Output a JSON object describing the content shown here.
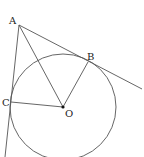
{
  "diagram": {
    "points": {
      "A": {
        "label": "A",
        "x": 19,
        "y": 25
      },
      "B": {
        "label": "B",
        "x": 88,
        "y": 62
      },
      "C": {
        "label": "C",
        "x": 11,
        "y": 102
      },
      "O": {
        "label": "O",
        "x": 63,
        "y": 107
      }
    },
    "circle": {
      "center": "O",
      "cx": 63,
      "cy": 107,
      "r": 53
    },
    "segments": [
      {
        "from": "A",
        "to": "O"
      },
      {
        "from": "O",
        "to": "B"
      },
      {
        "from": "O",
        "to": "C"
      }
    ],
    "lines": [
      {
        "through": [
          "A",
          "B"
        ],
        "note": "tangent at B"
      },
      {
        "through": [
          "A",
          "C"
        ],
        "note": "tangent at C"
      }
    ],
    "colors": {
      "stroke": "#555555",
      "center_dot": "#111111"
    }
  }
}
